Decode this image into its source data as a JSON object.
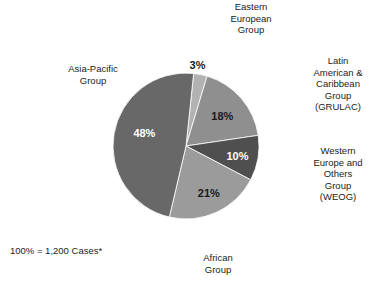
{
  "chart_data": {
    "type": "pie",
    "title": "",
    "subtitle": "",
    "xlabel": "",
    "ylabel": "",
    "legend_position": "callout-labels",
    "grid": false,
    "total_label": "100% = 1,200 Cases*",
    "total_value": 1200,
    "units": "Cases",
    "categories": [
      "Eastern European Group",
      "Latin American & Caribbean Group (GRULAC)",
      "Western Europe and Others Group (WEOG)",
      "African Group",
      "Asia-Pacific Group"
    ],
    "values": [
      3,
      18,
      10,
      21,
      48
    ],
    "value_labels": [
      "3%",
      "18%",
      "10%",
      "21%",
      "48%"
    ],
    "colors": [
      "#b2b2b2",
      "#8f8f8f",
      "#4f4f4f",
      "#9b9b9b",
      "#686868"
    ],
    "label_text_colors": [
      "#1a1a1a",
      "#1a1a1a",
      "#ffffff",
      "#1a1a1a",
      "#ffffff"
    ],
    "slices": [
      {
        "name": "Eastern European Group",
        "label_lines": "Eastern\nEuropean\nGroup",
        "value": 3,
        "value_label": "3%",
        "color": "#b2b2b2",
        "value_text_color": "#1a1a1a"
      },
      {
        "name": "Latin American & Caribbean Group (GRULAC)",
        "label_lines": "Latin\nAmerican &\nCaribbean\nGroup\n(GRULAC)",
        "value": 18,
        "value_label": "18%",
        "color": "#8f8f8f",
        "value_text_color": "#1a1a1a"
      },
      {
        "name": "Western Europe and Others Group (WEOG)",
        "label_lines": "Western\nEurope and\nOthers\nGroup\n(WEOG)",
        "value": 10,
        "value_label": "10%",
        "color": "#4f4f4f",
        "value_text_color": "#ffffff"
      },
      {
        "name": "African Group",
        "label_lines": "African\nGroup",
        "value": 21,
        "value_label": "21%",
        "color": "#9b9b9b",
        "value_text_color": "#1a1a1a"
      },
      {
        "name": "Asia-Pacific Group",
        "label_lines": "Asia-Pacific\nGroup",
        "value": 48,
        "value_label": "48%",
        "color": "#686868",
        "value_text_color": "#ffffff"
      }
    ],
    "geometry": {
      "cx": 186,
      "cy": 146,
      "r": 73,
      "start_angle_deg": -84
    }
  },
  "footnote": {
    "text": "100% = 1,200 Cases*"
  }
}
